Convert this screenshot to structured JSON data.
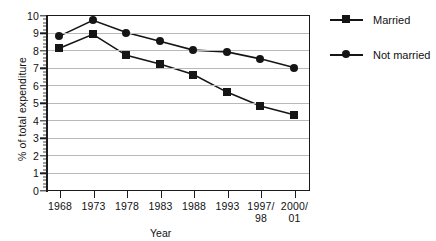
{
  "chart_data": {
    "type": "line",
    "title": "",
    "xlabel": "Year",
    "ylabel": "% of total expenditure",
    "categories": [
      "1968",
      "1973",
      "1978",
      "1983",
      "1988",
      "1993",
      "1997/\n98",
      "2000/\n01"
    ],
    "ylim": [
      0,
      10
    ],
    "ytick_labels": [
      "0",
      "1",
      "2",
      "3",
      "4",
      "5",
      "6",
      "7",
      "8",
      "9",
      "10"
    ],
    "ytick_values": [
      0,
      1,
      2,
      3,
      4,
      5,
      6,
      7,
      8,
      9,
      10
    ],
    "grid": true,
    "legend_position": "right",
    "series": [
      {
        "name": "Married",
        "marker": "square",
        "color": "#151515",
        "values": [
          8.1,
          8.9,
          7.7,
          7.2,
          6.6,
          5.6,
          4.8,
          4.3
        ]
      },
      {
        "name": "Not married",
        "marker": "circle",
        "color": "#151515",
        "values": [
          8.8,
          9.7,
          9.0,
          8.5,
          8.0,
          7.9,
          7.5,
          7.0
        ]
      }
    ]
  },
  "legend": {
    "items": [
      {
        "label": "Married",
        "marker": "square"
      },
      {
        "label": "Not married",
        "marker": "circle"
      }
    ]
  },
  "colors": {
    "series": "#151515",
    "grid": "#b9b9b9",
    "axis": "#1a1a1a",
    "background": "#ffffff"
  }
}
